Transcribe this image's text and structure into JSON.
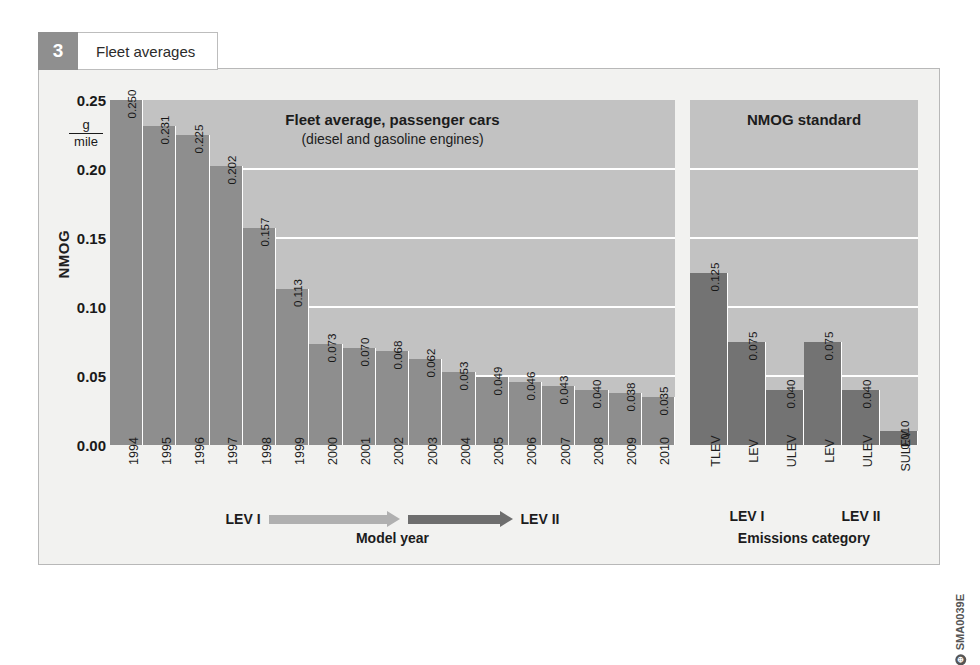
{
  "header": {
    "number": "3",
    "title": "Fleet averages"
  },
  "axes": {
    "y_title": "NMOG",
    "unit_numerator": "g",
    "unit_denominator": "mile",
    "y_ticks": [
      "0.25",
      "0.20",
      "0.15",
      "0.10",
      "0.05",
      "0.00"
    ],
    "left_caption": "Model year",
    "right_caption": "Emissions category"
  },
  "legend": {
    "lev_one": "LEV I",
    "lev_two": "LEV II",
    "arrow_light": "lev-i-arrow",
    "arrow_dark": "lev-ii-arrow"
  },
  "right_groups": [
    {
      "label": "LEV I"
    },
    {
      "label": "LEV II"
    }
  ],
  "watermark": {
    "code": "SMA0039E",
    "mark": "⊕"
  },
  "colors": {
    "panel_background": "#c2c2c2",
    "bar_fleet": "#8e8e8e",
    "bar_standard": "#737373",
    "gridline": "#ffffff",
    "frame_background": "#f2f2f0",
    "badge": "#8f8f8f"
  },
  "chart_data": [
    {
      "type": "bar",
      "id": "fleet-average",
      "title": "Fleet average, passenger cars",
      "subtitle": "(diesel and gasoline engines)",
      "xlabel": "Model year",
      "ylabel": "NMOG",
      "yunit": "g/mile",
      "ylim": [
        0.0,
        0.25
      ],
      "yticks": [
        0.0,
        0.05,
        0.1,
        0.15,
        0.2,
        0.25
      ],
      "grid": true,
      "legend": "none",
      "categories": [
        "1994",
        "1995",
        "1996",
        "1997",
        "1998",
        "1999",
        "2000",
        "2001",
        "2002",
        "2003",
        "2004",
        "2005",
        "2006",
        "2007",
        "2008",
        "2009",
        "2010"
      ],
      "values": [
        0.25,
        0.231,
        0.225,
        0.202,
        0.157,
        0.113,
        0.073,
        0.07,
        0.068,
        0.062,
        0.053,
        0.049,
        0.046,
        0.043,
        0.04,
        0.038,
        0.035
      ],
      "value_labels": [
        "0.250",
        "0.231",
        "0.225",
        "0.202",
        "0.157",
        "0.113",
        "0.073",
        "0.070",
        "0.068",
        "0.062",
        "0.053",
        "0.049",
        "0.046",
        "0.043",
        "0.040",
        "0.038",
        "0.035"
      ]
    },
    {
      "type": "bar",
      "id": "nmog-standard",
      "title": "NMOG standard",
      "subtitle": "",
      "xlabel": "Emissions category",
      "ylabel": "NMOG",
      "yunit": "g/mile",
      "ylim": [
        0.0,
        0.25
      ],
      "yticks": [
        0.0,
        0.05,
        0.1,
        0.15,
        0.2,
        0.25
      ],
      "grid": true,
      "legend": "none",
      "categories": [
        "TLEV",
        "LEV",
        "ULEV",
        "LEV",
        "ULEV",
        "SULEV"
      ],
      "groups": [
        "LEV I",
        "LEV I",
        "LEV I",
        "LEV II",
        "LEV II",
        "LEV II"
      ],
      "values": [
        0.125,
        0.075,
        0.04,
        0.075,
        0.04,
        0.01
      ],
      "value_labels": [
        "0.125",
        "0.075",
        "0.040",
        "0.075",
        "0.040",
        "0.010"
      ]
    }
  ]
}
